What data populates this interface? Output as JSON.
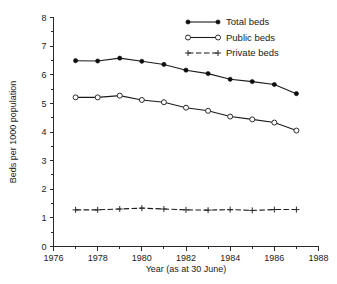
{
  "chart_data": {
    "type": "line",
    "title": "",
    "xlabel": "Year (as at 30 June)",
    "ylabel": "Beds per 1000 population",
    "x": [
      1977,
      1978,
      1979,
      1980,
      1981,
      1982,
      1983,
      1984,
      1985,
      1986,
      1987
    ],
    "xlim": [
      1976,
      1988
    ],
    "ylim": [
      0,
      8
    ],
    "xticks": [
      1976,
      1978,
      1980,
      1982,
      1984,
      1986,
      1988
    ],
    "xticks_minor": [
      1977,
      1979,
      1981,
      1983,
      1985,
      1987
    ],
    "yticks": [
      0,
      1,
      2,
      3,
      4,
      5,
      6,
      7,
      8
    ],
    "grid": false,
    "legend_position": "top-right",
    "series": [
      {
        "name": "Total beds",
        "marker": "filled-circle",
        "linestyle": "solid",
        "values": [
          6.49,
          6.48,
          6.58,
          6.47,
          6.36,
          6.16,
          6.04,
          5.84,
          5.76,
          5.66,
          5.34
        ]
      },
      {
        "name": "Public beds",
        "marker": "open-circle",
        "linestyle": "solid",
        "values": [
          5.21,
          5.21,
          5.27,
          5.12,
          5.04,
          4.85,
          4.74,
          4.54,
          4.44,
          4.33,
          4.05
        ]
      },
      {
        "name": "Private beds",
        "marker": "plus",
        "linestyle": "dashed",
        "values": [
          1.28,
          1.28,
          1.31,
          1.34,
          1.31,
          1.28,
          1.27,
          1.29,
          1.26,
          1.29,
          1.29
        ]
      }
    ]
  },
  "axes": {
    "y_title": "Beds per 1000 population",
    "x_title": "Year (as at 30 June)",
    "y_tick_labels": [
      "0",
      "1",
      "2",
      "3",
      "4",
      "5",
      "6",
      "7",
      "8"
    ],
    "x_tick_labels": [
      "1976",
      "1978",
      "1980",
      "1982",
      "1984",
      "1986",
      "1988"
    ]
  },
  "legend": {
    "items": [
      {
        "label": "Total beds",
        "marker": "filled-circle-icon"
      },
      {
        "label": "Public beds",
        "marker": "open-circle-icon"
      },
      {
        "label": "Private beds",
        "marker": "plus-marker-icon"
      }
    ]
  }
}
